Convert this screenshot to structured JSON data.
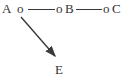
{
  "diagram": {
    "background_color": "#ffffff",
    "ink_color": "#3a3a3a",
    "node_marker": "o",
    "labels": {
      "a": "A",
      "b": "B",
      "c": "C",
      "e": "E"
    },
    "edges": [
      {
        "type": "line",
        "from": "A-marker",
        "to": "B-marker"
      },
      {
        "type": "line",
        "from": "B-marker",
        "to": "C-marker"
      },
      {
        "type": "arrow",
        "from": "A-marker",
        "to": "E"
      }
    ]
  }
}
